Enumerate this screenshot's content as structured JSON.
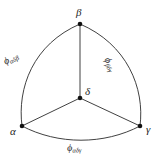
{
  "figure": {
    "background_color": "#ffffff",
    "stroke_color": "#2b2b2b",
    "vertex_color": "#111111",
    "vertices": [
      {
        "id": "beta",
        "label": "β",
        "x": 80,
        "y": 24
      },
      {
        "id": "delta",
        "label": "δ",
        "x": 80,
        "y": 98
      },
      {
        "id": "alpha",
        "label": "α",
        "x": 22,
        "y": 126
      },
      {
        "id": "gamma",
        "label": "γ",
        "x": 140,
        "y": 126
      }
    ],
    "straight_edges": [
      {
        "id": "delta-beta",
        "from": "delta",
        "to": "beta"
      },
      {
        "id": "delta-alpha",
        "from": "delta",
        "to": "alpha"
      },
      {
        "id": "delta-gamma",
        "from": "delta",
        "to": "gamma"
      }
    ],
    "arcs": [
      {
        "id": "arc-alpha-beta",
        "from": "alpha",
        "to": "beta",
        "path": "M 22 126 C 17 88 33 44 80 24",
        "label_phi": "ϕ",
        "label_subscript": "αδβ"
      },
      {
        "id": "arc-beta-gamma",
        "from": "beta",
        "to": "gamma",
        "path": "M 80 24 C 127 44 145 88 140 126",
        "label_phi": "ϕ",
        "label_subscript": "βδγ"
      },
      {
        "id": "arc-alpha-gamma",
        "from": "alpha",
        "to": "gamma",
        "path": "M 22 126 C 58 145 104 145 140 126",
        "label_phi": "ϕ",
        "label_subscript": "αδγ"
      }
    ]
  }
}
